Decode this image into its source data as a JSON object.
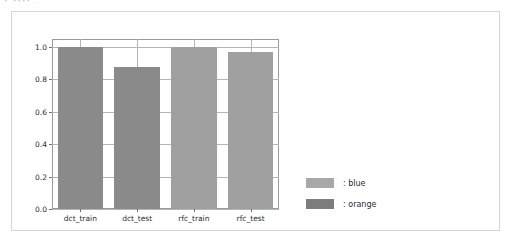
{
  "top_fragment": "· ···· ,",
  "panel": {
    "name": "chart-card"
  },
  "chart_data": {
    "type": "bar",
    "title": "",
    "xlabel": "",
    "ylabel": "",
    "categories": [
      "dct_train",
      "dct_test",
      "rfc_train",
      "rfc_test"
    ],
    "values": [
      1.0,
      0.875,
      1.0,
      0.97
    ],
    "bar_colors": [
      "#8a8a8a",
      "#8a8a8a",
      "#a0a0a0",
      "#a0a0a0"
    ],
    "ylim": [
      0.0,
      1.05
    ],
    "yticks": [
      0.0,
      0.2,
      0.4,
      0.6,
      0.8,
      1.0
    ],
    "ytick_labels": [
      "0.0",
      "0.2",
      "0.4",
      "0.6",
      "0.8",
      "1.0"
    ],
    "grid": true,
    "legend_position": "right",
    "legend": [
      {
        "label": ": blue",
        "color": "#a8a8a8"
      },
      {
        "label": ": orange",
        "color": "#7d7d7d"
      }
    ]
  },
  "colors": {
    "axis": "#9a9a9a",
    "grid": "#b5b5b5",
    "panel_border": "#d6d6d6",
    "text": "#2b2b2b",
    "background": "#ffffff"
  }
}
